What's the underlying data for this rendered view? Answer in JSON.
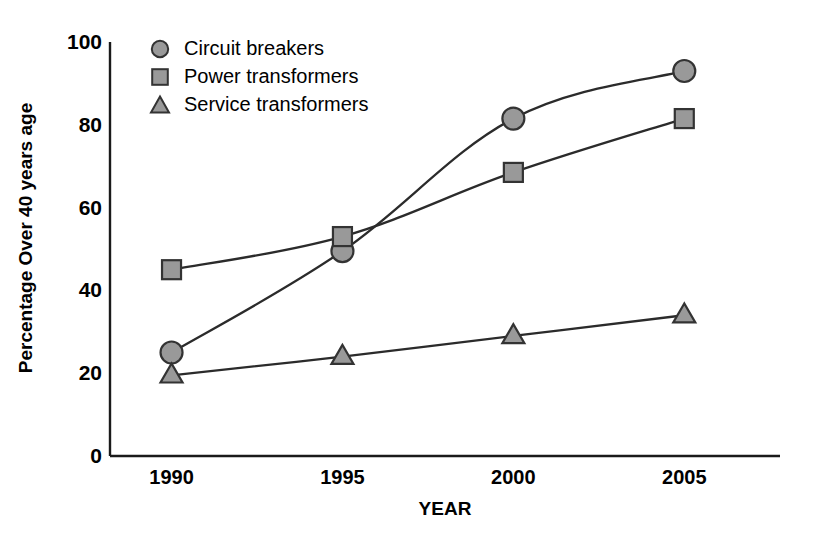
{
  "chart_data": {
    "type": "line",
    "title": "",
    "xlabel": "YEAR",
    "ylabel": "Percentage Over 40 years age",
    "categories": [
      "1990",
      "1995",
      "2000",
      "2005"
    ],
    "x": [
      1990,
      1995,
      2000,
      2005
    ],
    "xlim": [
      1988.2,
      2007.8
    ],
    "ylim": [
      0,
      100
    ],
    "yticks": [
      "0",
      "20",
      "40",
      "60",
      "80",
      "100"
    ],
    "ytick_values": [
      0,
      20,
      40,
      60,
      80,
      100
    ],
    "xticks": [
      "1990",
      "1995",
      "2000",
      "2005"
    ],
    "grid": false,
    "legend_position": "upper left",
    "series": [
      {
        "name": "Circuit breakers",
        "marker": "circle",
        "values": [
          25,
          49.5,
          81.5,
          93
        ],
        "color": "#999999",
        "edge_color": "#333333",
        "line_color": "#2b2b2b"
      },
      {
        "name": "Power transformers",
        "marker": "square",
        "values": [
          45,
          53,
          68.5,
          81.5
        ],
        "color": "#999999",
        "edge_color": "#333333",
        "line_color": "#2b2b2b"
      },
      {
        "name": "Service transformers",
        "marker": "triangle",
        "values": [
          19.5,
          24,
          29,
          34
        ],
        "color": "#999999",
        "edge_color": "#333333",
        "line_color": "#2b2b2b"
      }
    ]
  },
  "axis": {
    "line_color": "#1a1a1a",
    "background": "#ffffff"
  },
  "legend": {
    "items": [
      {
        "label": "Circuit breakers",
        "marker": "circle-marker-icon"
      },
      {
        "label": "Power transformers",
        "marker": "square-marker-icon"
      },
      {
        "label": "Service transformers",
        "marker": "triangle-marker-icon"
      }
    ]
  }
}
